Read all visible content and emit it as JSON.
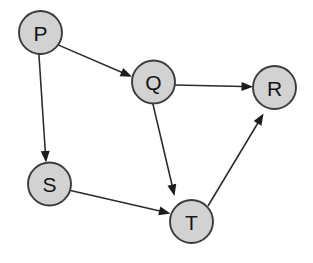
{
  "figure": {
    "kind": "directed-graph",
    "title": "",
    "background_color": "#ffffff",
    "width": 313,
    "height": 263
  },
  "style": {
    "node_fill": "#d2d2d2",
    "node_stroke": "#3b3b3b",
    "node_radius": 21.5,
    "label_color": "#151515",
    "edge_color": "#2b2b2b",
    "arrowhead_color": "#1d1d1d"
  },
  "nodes": [
    {
      "id": "P",
      "label": "P",
      "cx": 40.5,
      "cy": 32.5,
      "r": 21.5
    },
    {
      "id": "Q",
      "label": "Q",
      "cx": 153.5,
      "cy": 82.0,
      "r": 21.5
    },
    {
      "id": "R",
      "label": "R",
      "cx": 274.5,
      "cy": 87.5,
      "r": 21.5
    },
    {
      "id": "S",
      "label": "S",
      "cx": 49.5,
      "cy": 184.0,
      "r": 21.5
    },
    {
      "id": "T",
      "label": "T",
      "cx": 191.5,
      "cy": 221.5,
      "r": 21.5
    }
  ],
  "edges": [
    {
      "id": "P-Q",
      "from": "P",
      "to": "Q",
      "label": "",
      "directed": true,
      "x1": 58.0,
      "y1": 44.9,
      "x2": 124.5,
      "y2": 73.5,
      "hx": 132.0,
      "hy": 76.7,
      "angle": 23.3
    },
    {
      "id": "P-S",
      "from": "P",
      "to": "S",
      "label": "",
      "directed": true,
      "x1": 38.9,
      "y1": 54.0,
      "x2": 45.4,
      "y2": 153.5,
      "hx": 46.0,
      "hy": 162.5,
      "angle": 86.3
    },
    {
      "id": "Q-R",
      "from": "Q",
      "to": "R",
      "label": "",
      "directed": true,
      "x1": 175.0,
      "y1": 85.0,
      "x2": 243.5,
      "y2": 86.6,
      "hx": 253.0,
      "hy": 86.8,
      "angle": 1.3
    },
    {
      "id": "Q-T",
      "from": "Q",
      "to": "T",
      "label": "",
      "directed": true,
      "x1": 152.8,
      "y1": 103.5,
      "x2": 172.5,
      "y2": 187.0,
      "hx": 174.5,
      "hy": 196.0,
      "angle": 76.7
    },
    {
      "id": "S-T",
      "from": "S",
      "to": "T",
      "label": "",
      "directed": true,
      "x1": 70.5,
      "y1": 190.6,
      "x2": 161.0,
      "y2": 211.3,
      "hx": 170.5,
      "hy": 213.5,
      "angle": 12.9
    },
    {
      "id": "T-R",
      "from": "T",
      "to": "R",
      "label": "",
      "directed": true,
      "x1": 208.0,
      "y1": 206.0,
      "x2": 258.5,
      "y2": 122.0,
      "hx": 263.5,
      "hy": 113.5,
      "angle": -59.0
    }
  ],
  "adjacency": {
    "P": [
      "Q",
      "S"
    ],
    "Q": [
      "R",
      "T"
    ],
    "R": [],
    "S": [
      "T"
    ],
    "T": [
      "R"
    ]
  },
  "counts": {
    "nodes": 5,
    "edges": 6
  }
}
